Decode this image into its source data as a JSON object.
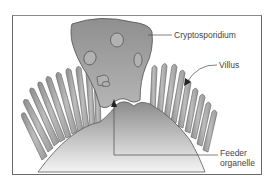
{
  "diagram": {
    "labels": {
      "cryptosporidium": "Cryptosporidium",
      "villus": "Villus",
      "feeder_line1": "Feeder",
      "feeder_line2": "organelle"
    },
    "colors": {
      "parasite_fill": "#9a9a9a",
      "villus_fill": "#a8a8a8",
      "outline": "#5a5a5a",
      "host_gradient_top": "#8c8c8c",
      "host_gradient_bottom": "#f2f2f2",
      "frame": "#6a6a6a",
      "text": "#444444"
    }
  }
}
